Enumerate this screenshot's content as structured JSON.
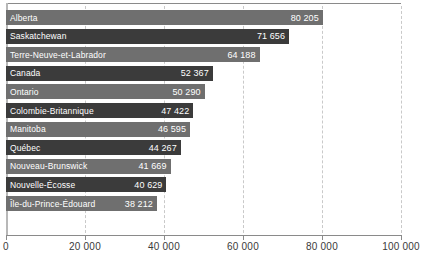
{
  "chart_data": {
    "type": "bar",
    "orientation": "horizontal",
    "title": "",
    "subtitle": "",
    "xlabel": "",
    "ylabel": "",
    "xlim": [
      0,
      100000
    ],
    "grid": true,
    "legend": null,
    "categories": [
      "Alberta",
      "Saskatchewan",
      "Terre-Neuve-et-Labrador",
      "Canada",
      "Ontario",
      "Colombie-Britannique",
      "Manitoba",
      "Québec",
      "Nouveau-Brunswick",
      "Nouvelle-Écosse",
      "Île-du-Prince-Édouard"
    ],
    "values": [
      80205,
      71656,
      64188,
      52367,
      50290,
      47422,
      46595,
      44267,
      41669,
      40629,
      38212
    ],
    "value_labels": [
      "80 205",
      "71 656",
      "64 188",
      "52 367",
      "50 290",
      "47 422",
      "46 595",
      "44 267",
      "41 669",
      "40 629",
      "38 212"
    ],
    "bar_styles": [
      "light",
      "dark",
      "light",
      "dark",
      "light",
      "dark",
      "light",
      "dark",
      "light",
      "dark",
      "light"
    ],
    "xticks": [
      0,
      20000,
      40000,
      60000,
      80000,
      100000
    ],
    "xtick_labels": [
      "0",
      "20 000",
      "40 000",
      "60 000",
      "80 000",
      "100 000"
    ],
    "colors": {
      "bar_light": "#6f6f6f",
      "bar_dark": "#3b3b3b",
      "bar_text": "#ffffff",
      "gridline": "#c9c9c9",
      "axis": "#8a8a8a",
      "tick_text": "#3a3a3a",
      "background": "#ffffff"
    }
  }
}
